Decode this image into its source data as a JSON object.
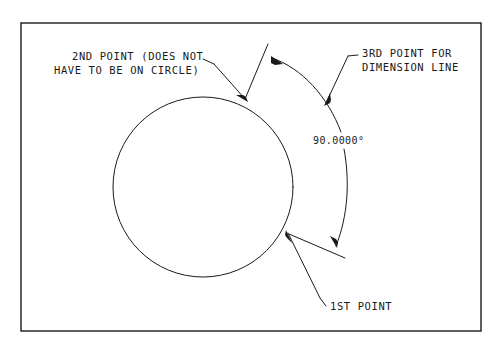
{
  "diagram": {
    "title_text": "",
    "frame": {
      "x": 21,
      "y": 23,
      "width": 460,
      "height": 308,
      "stroke": "#1a1a1a"
    },
    "circle": {
      "cx": 203,
      "cy": 187,
      "r": 90,
      "stroke": "#1a1a1a"
    },
    "labels": {
      "second_point_line1": "2ND POINT (DOES NOT",
      "second_point_line2": "HAVE TO BE ON CIRCLE)",
      "third_point_line1": "3RD POINT FOR",
      "third_point_line2": "DIMENSION LINE",
      "dimension_value": "90.0000°",
      "first_point": "1ST POINT"
    },
    "geometry_notes": {
      "first_point_on_circle": [
        287,
        232
      ],
      "second_point_on_circle": [
        247,
        101
      ],
      "third_point_on_arc": [
        325,
        104
      ],
      "dimension_arc_start": [
        272,
        57
      ],
      "dimension_arc_end": [
        337,
        247
      ]
    },
    "colors": {
      "line": "#1a1a1a",
      "background": "#ffffff"
    }
  }
}
